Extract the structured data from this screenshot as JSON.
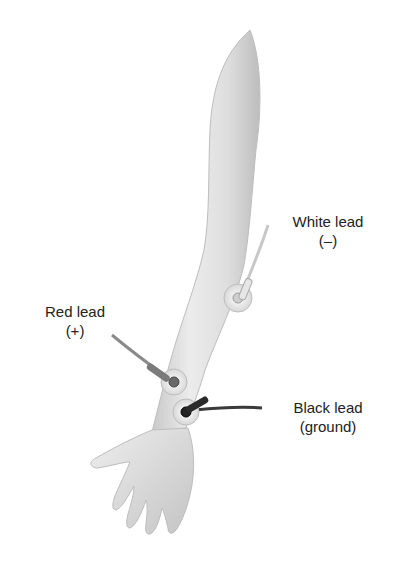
{
  "figure": {
    "labels": {
      "white": {
        "line1": "White lead",
        "line2": "(–)"
      },
      "red": {
        "line1": "Red lead",
        "line2": "(+)"
      },
      "black": {
        "line1": "Black lead",
        "line2": "(ground)"
      }
    },
    "colors": {
      "background": "#ffffff",
      "skin_light": "#f2f2f2",
      "skin_mid": "#d6d6d6",
      "skin_shadow": "#b0b0b0",
      "lead_red": "#7a7a7a",
      "lead_white": "#dcdcdc",
      "lead_black": "#2a2a2a",
      "text": "#222222"
    }
  }
}
